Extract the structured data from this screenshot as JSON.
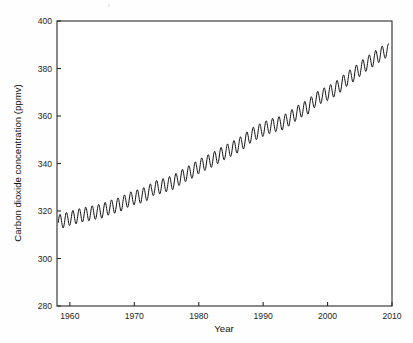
{
  "figure": {
    "background_color": "#fefefe",
    "plot_background_color": "#ffffff",
    "line_color": "#101010",
    "axis_color": "#2a2a2a"
  },
  "axis": {
    "x_title": "Year",
    "y_title": "Carbon dioxide concentration (ppmv)",
    "x_tick_labels": [
      "1960",
      "1970",
      "1980",
      "1990",
      "2000",
      "2010"
    ],
    "y_tick_labels": [
      "280",
      "300",
      "320",
      "340",
      "360",
      "380",
      "400"
    ]
  },
  "chart_data": {
    "type": "line",
    "title": "",
    "subtitle": "",
    "xlabel": "Year",
    "ylabel": "Carbon dioxide concentration (ppmv)",
    "xlim": [
      1958,
      2010
    ],
    "ylim": [
      280,
      400
    ],
    "xticks": [
      1960,
      1970,
      1980,
      1990,
      2000,
      2010
    ],
    "yticks": [
      280,
      300,
      320,
      340,
      360,
      380,
      400
    ],
    "grid": false,
    "legend": null,
    "series": [
      {
        "name": "Atmospheric CO2 (monthly mean)",
        "color": "#101010",
        "description": "Monthly mean atmospheric carbon dioxide concentration showing a rising trend with a regular annual seasonal oscillation of about 6 ppmv peak-to-peak.",
        "seasonal_amplitude_ppmv": 6.0,
        "annual_means": {
          "x": [
            1958,
            1959,
            1960,
            1961,
            1962,
            1963,
            1964,
            1965,
            1966,
            1967,
            1968,
            1969,
            1970,
            1971,
            1972,
            1973,
            1974,
            1975,
            1976,
            1977,
            1978,
            1979,
            1980,
            1981,
            1982,
            1983,
            1984,
            1985,
            1986,
            1987,
            1988,
            1989,
            1990,
            1991,
            1992,
            1993,
            1994,
            1995,
            1996,
            1997,
            1998,
            1999,
            2000,
            2001,
            2002,
            2003,
            2004,
            2005,
            2006,
            2007,
            2008,
            2009
          ],
          "y": [
            315.3,
            315.9,
            316.9,
            317.6,
            318.4,
            318.9,
            319.5,
            320.0,
            321.3,
            322.1,
            323.0,
            324.6,
            325.6,
            326.3,
            327.4,
            329.6,
            330.2,
            331.1,
            332.0,
            333.8,
            335.4,
            336.8,
            338.7,
            340.1,
            341.4,
            343.0,
            344.6,
            346.0,
            347.4,
            349.2,
            351.6,
            353.1,
            354.4,
            355.6,
            356.4,
            357.1,
            358.8,
            360.8,
            362.6,
            363.8,
            366.6,
            368.3,
            369.5,
            371.0,
            373.1,
            375.6,
            377.4,
            379.7,
            381.9,
            383.7,
            385.6,
            387.4
          ]
        }
      }
    ]
  }
}
